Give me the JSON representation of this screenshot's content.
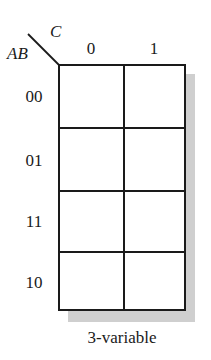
{
  "kmap": {
    "row_variable": "AB",
    "column_variable": "C",
    "column_labels": [
      "0",
      "1"
    ],
    "row_labels": [
      "00",
      "01",
      "11",
      "10"
    ],
    "cells": [
      [
        "",
        ""
      ],
      [
        "",
        ""
      ],
      [
        "",
        ""
      ],
      [
        "",
        ""
      ]
    ],
    "caption": "3-variable"
  }
}
